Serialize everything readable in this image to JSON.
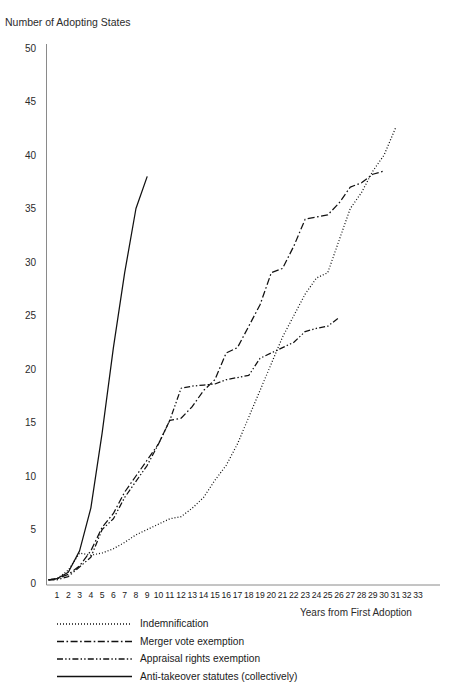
{
  "figure": {
    "ghost_text_top": "",
    "y_axis_title": "Number of Adopting States",
    "x_axis_title": "Years from First Adoption"
  },
  "chart_data": {
    "type": "line",
    "title": "",
    "subtitle": "",
    "xlabel": "Years from First Adoption",
    "ylabel": "Number of Adopting States",
    "xlim": [
      0,
      34
    ],
    "ylim": [
      0,
      50
    ],
    "grid": false,
    "legend_position": "below-left",
    "x_ticks": [
      1,
      2,
      3,
      4,
      5,
      6,
      7,
      8,
      9,
      10,
      11,
      12,
      13,
      14,
      15,
      16,
      17,
      18,
      19,
      20,
      21,
      22,
      23,
      24,
      25,
      26,
      27,
      28,
      29,
      30,
      31,
      32,
      33
    ],
    "y_ticks": [
      0,
      5,
      10,
      15,
      20,
      25,
      30,
      35,
      40,
      45,
      50
    ],
    "x": [
      1,
      2,
      3,
      4,
      5,
      6,
      7,
      8,
      9,
      10,
      11,
      12,
      13,
      14,
      15,
      16,
      17,
      18,
      19,
      20,
      21,
      22,
      23,
      24,
      25,
      26,
      27,
      28,
      29,
      30,
      31,
      32,
      33
    ],
    "series": [
      {
        "name": "Indemnification",
        "style": "dotted",
        "values": [
          0.4,
          1.2,
          2.8,
          2.6,
          2.8,
          3.2,
          3.8,
          4.5,
          5.0,
          5.5,
          6.0,
          6.2,
          7.0,
          8.0,
          9.6,
          11.0,
          13.0,
          15.5,
          18.0,
          20.5,
          23.0,
          25.0,
          27.0,
          28.5,
          29.0,
          32.0,
          35.0,
          36.5,
          38.5,
          40.0,
          42.5,
          null,
          null
        ]
      },
      {
        "name": "Merger vote exemption",
        "style": "dash-dot",
        "values": [
          0.4,
          0.8,
          1.6,
          3.0,
          5.2,
          6.5,
          8.5,
          10.0,
          11.5,
          13.0,
          15.2,
          15.4,
          16.5,
          18.0,
          19.0,
          21.5,
          22.0,
          24.0,
          26.0,
          29.0,
          29.4,
          31.5,
          34.0,
          34.2,
          34.4,
          35.5,
          37.0,
          37.4,
          38.2,
          38.5,
          null,
          null,
          null
        ]
      },
      {
        "name": "Appraisal rights exemption",
        "style": "dash-dot-dot",
        "values": [
          0.3,
          0.6,
          1.5,
          2.4,
          5.0,
          6.0,
          8.0,
          9.5,
          11.0,
          13.0,
          15.2,
          18.2,
          18.4,
          18.5,
          18.6,
          19.0,
          19.2,
          19.4,
          21.0,
          21.5,
          22.0,
          22.5,
          23.5,
          23.8,
          24.0,
          24.8,
          null,
          null,
          null,
          null,
          null,
          null,
          null
        ]
      },
      {
        "name": "Anti-takeover statutes (collectively)",
        "style": "solid",
        "values": [
          0.4,
          1.0,
          3.0,
          7.0,
          14.0,
          22.0,
          29.0,
          35.0,
          38.0,
          null,
          null,
          null,
          null,
          null,
          null,
          null,
          null,
          null,
          null,
          null,
          null,
          null,
          null,
          null,
          null,
          null,
          null,
          null,
          null,
          null,
          null,
          null,
          null
        ]
      }
    ],
    "legend": [
      {
        "label": "Indemnification",
        "style": "dotted"
      },
      {
        "label": "Merger vote exemption",
        "style": "dash-dot"
      },
      {
        "label": "Appraisal rights exemption",
        "style": "dash-dot-dot"
      },
      {
        "label": "Anti-takeover statutes (collectively)",
        "style": "solid"
      }
    ],
    "colors": {
      "line": "#111111",
      "axis": "#8a8a8a",
      "text": "#1a1a1a"
    }
  }
}
